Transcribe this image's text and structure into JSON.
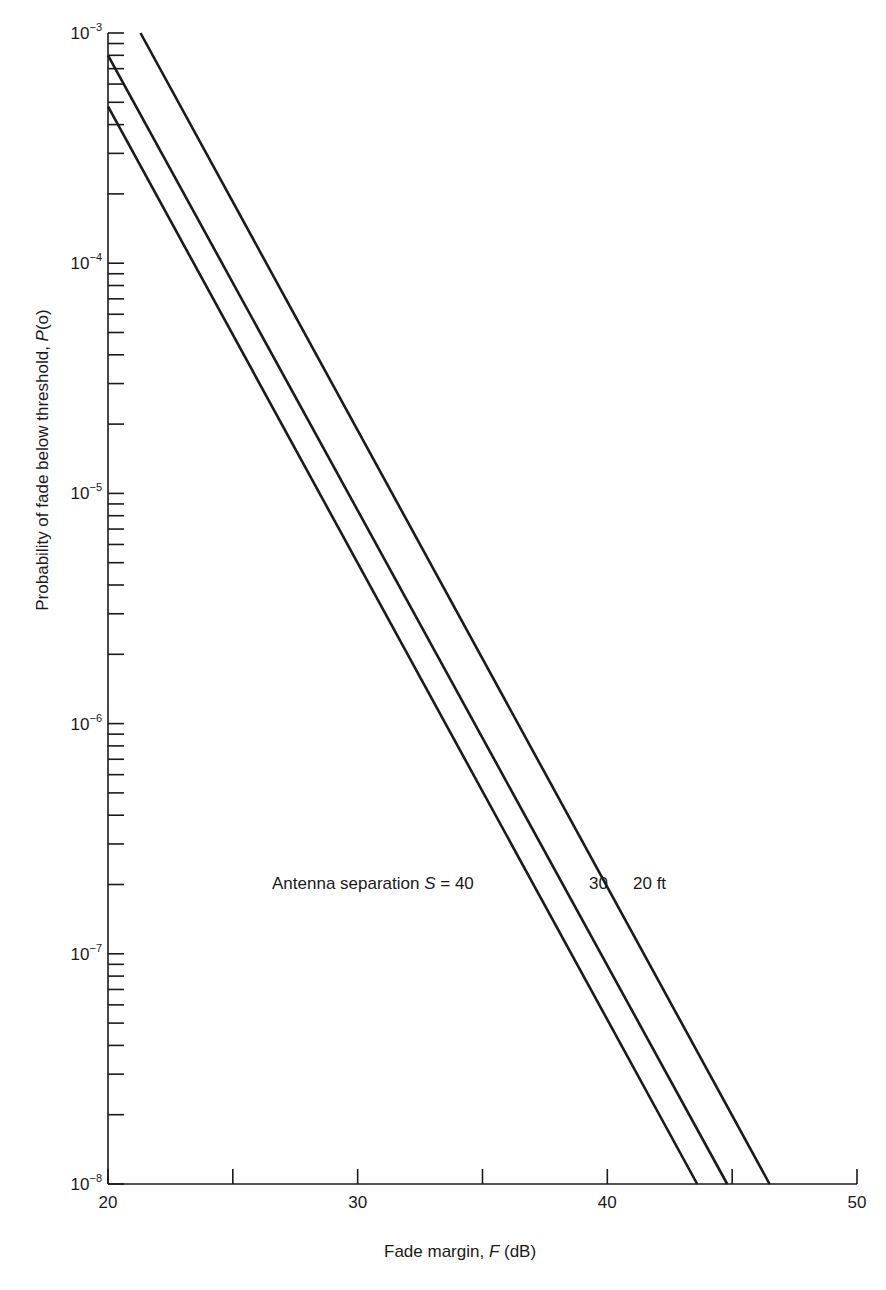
{
  "chart_data": {
    "type": "line",
    "title": "",
    "xlabel": "Fade margin, F (dB)",
    "xlabel_parts": {
      "pre": "Fade margin, ",
      "var": "F",
      "post": " (dB)"
    },
    "ylabel": "Probability of fade below threshold, P(o)",
    "ylabel_parts": {
      "pre": "Probability of fade below threshold, ",
      "var": "P",
      "post": "(o)"
    },
    "xlim": [
      20,
      50
    ],
    "ylim": [
      1e-08,
      0.001
    ],
    "yscale": "log",
    "grid": false,
    "x_ticks": [
      20,
      25,
      30,
      35,
      40,
      45,
      50
    ],
    "x_tick_labels": [
      "20",
      "",
      "30",
      "",
      "40",
      "",
      "50"
    ],
    "y_tick_labels": [
      {
        "base": "10",
        "exp": "−3",
        "value": 0.001
      },
      {
        "base": "10",
        "exp": "−4",
        "value": 0.0001
      },
      {
        "base": "10",
        "exp": "−5",
        "value": 1e-05
      },
      {
        "base": "10",
        "exp": "−6",
        "value": 1e-06
      },
      {
        "base": "10",
        "exp": "−7",
        "value": 1e-07
      },
      {
        "base": "10",
        "exp": "−8",
        "value": 1e-08
      }
    ],
    "series": [
      {
        "name": "S = 20 ft",
        "x": [
          21.3,
          46.5
        ],
        "y": [
          0.001,
          1e-08
        ]
      },
      {
        "name": "S = 30 ft",
        "x": [
          20.0,
          44.8
        ],
        "y": [
          0.0008,
          1e-08
        ]
      },
      {
        "name": "S = 40 ft",
        "x": [
          20.0,
          43.6
        ],
        "y": [
          0.00048,
          1e-08
        ]
      }
    ],
    "annotation": {
      "prefix": "Antenna separation ",
      "var": "S",
      "eq": " = 40",
      "label_30": "30",
      "label_20": "20 ft"
    },
    "legend": "inline annotation"
  },
  "colors": {
    "line": "#1a1a1a",
    "background": "#ffffff"
  }
}
